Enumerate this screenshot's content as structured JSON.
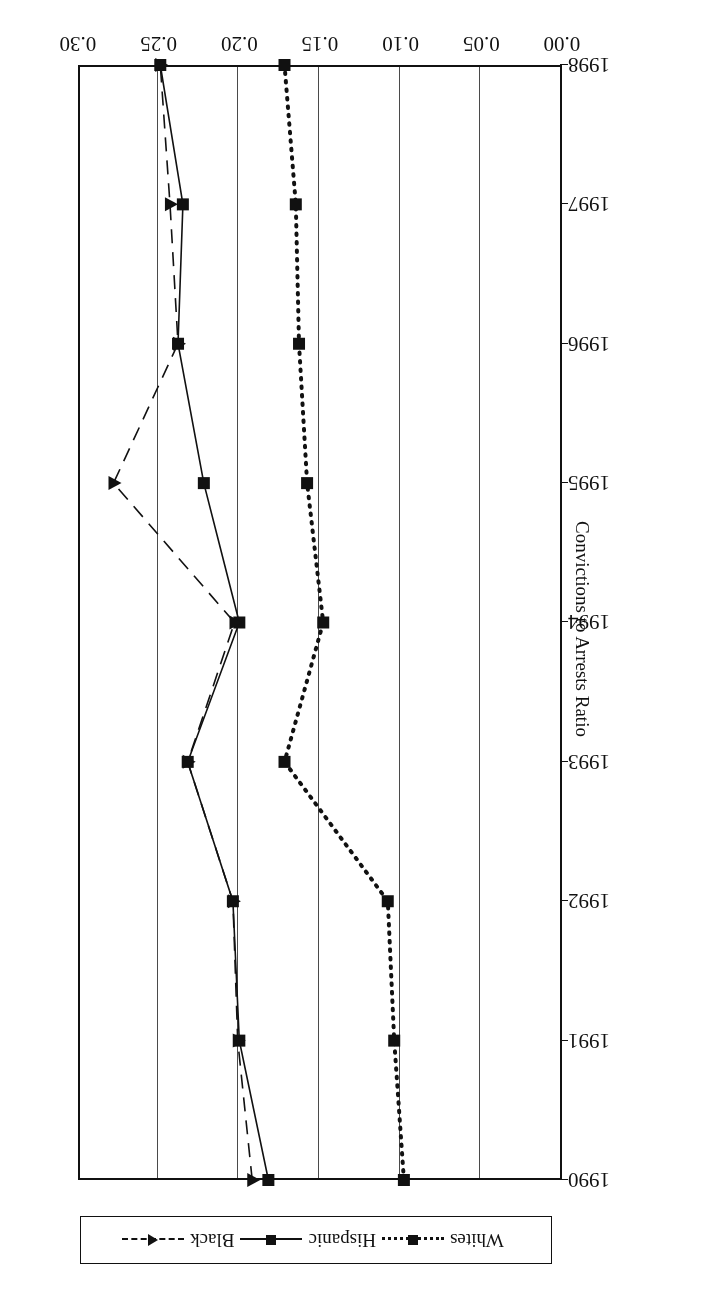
{
  "chart_data": {
    "type": "line",
    "title": "Drug Offenses",
    "xlabel": "",
    "ylabel": "Convictions to Arrests Ratio",
    "orientation": "rotated-180",
    "grid": true,
    "legend_position": "below-plot",
    "x": [
      1990,
      1991,
      1992,
      1993,
      1994,
      1995,
      1996,
      1997,
      1998
    ],
    "x_tick_labels": [
      "1990",
      "1991",
      "1992",
      "1993",
      "1994",
      "1995",
      "1996",
      "1997",
      "1998"
    ],
    "y_tick_labels": [
      "0.00",
      "0.05",
      "0.10",
      "0.15",
      "0.20",
      "0.25",
      "0.30"
    ],
    "y_tick_values": [
      0.0,
      0.05,
      0.1,
      0.15,
      0.2,
      0.25,
      0.3
    ],
    "ylim": [
      0.0,
      0.3
    ],
    "series": [
      {
        "name": "Whites",
        "marker": "square",
        "line_style": "dotted",
        "color": "#111111",
        "values": [
          0.098,
          0.104,
          0.108,
          0.172,
          0.148,
          0.158,
          0.163,
          0.165,
          0.172
        ]
      },
      {
        "name": "Hispanic",
        "marker": "square",
        "line_style": "solid",
        "color": "#111111",
        "values": [
          0.182,
          0.2,
          0.204,
          0.232,
          0.2,
          0.222,
          0.238,
          0.235,
          0.249
        ]
      },
      {
        "name": "Black",
        "marker": "triangle",
        "line_style": "dashed",
        "color": "#111111",
        "values": [
          0.192,
          0.201,
          0.204,
          0.232,
          0.203,
          0.278,
          0.238,
          0.243,
          0.249
        ]
      }
    ]
  },
  "legend": {
    "items": [
      {
        "label": "Whites",
        "marker": "square",
        "line_style": "dotted"
      },
      {
        "label": "Hispanic",
        "marker": "square",
        "line_style": "solid"
      },
      {
        "label": "Black",
        "marker": "triangle",
        "line_style": "dashed"
      }
    ]
  }
}
